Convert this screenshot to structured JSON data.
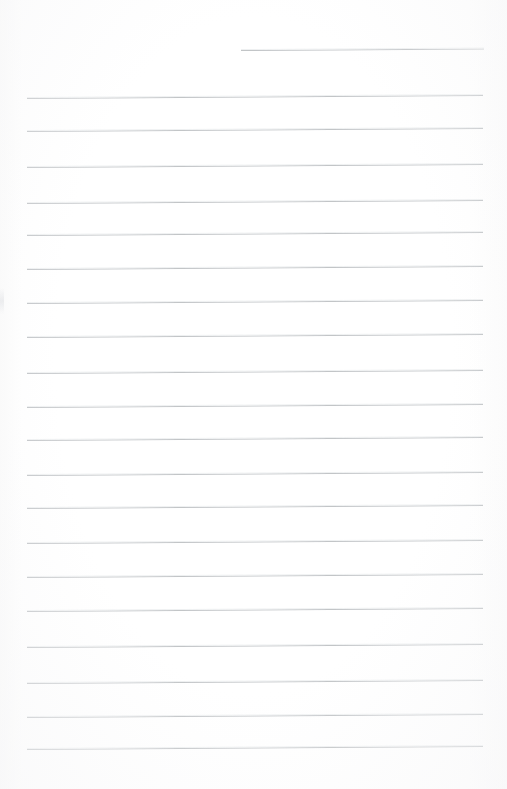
{
  "document": {
    "kind": "scanned-lined-paper",
    "title": "Blank lined notebook page",
    "page_width": 507,
    "page_height": 789,
    "background_color": "#ffffff",
    "rule_color": "#bfc2c5",
    "rule_thickness_px": 1,
    "rule_spacing_px": 34,
    "skew_degrees": -0.38,
    "text_content": "",
    "line_count": 21,
    "margin_left_px": 27,
    "margin_right_px": 483
  },
  "rules": [
    {
      "id": "rule-1",
      "y": 50,
      "x_start": 241,
      "x_end": 484,
      "variant": "short"
    },
    {
      "id": "rule-2",
      "y": 98,
      "x_start": 27,
      "x_end": 483,
      "variant": "full"
    },
    {
      "id": "rule-3",
      "y": 131,
      "x_start": 27,
      "x_end": 483,
      "variant": "full"
    },
    {
      "id": "rule-4",
      "y": 167,
      "x_start": 27,
      "x_end": 483,
      "variant": "full"
    },
    {
      "id": "rule-5",
      "y": 203,
      "x_start": 27,
      "x_end": 483,
      "variant": "full"
    },
    {
      "id": "rule-6",
      "y": 235,
      "x_start": 27,
      "x_end": 483,
      "variant": "full"
    },
    {
      "id": "rule-7",
      "y": 269,
      "x_start": 27,
      "x_end": 483,
      "variant": "full"
    },
    {
      "id": "rule-8",
      "y": 303,
      "x_start": 27,
      "x_end": 483,
      "variant": "full"
    },
    {
      "id": "rule-9",
      "y": 337,
      "x_start": 27,
      "x_end": 483,
      "variant": "full"
    },
    {
      "id": "rule-10",
      "y": 373,
      "x_start": 27,
      "x_end": 483,
      "variant": "full"
    },
    {
      "id": "rule-11",
      "y": 407,
      "x_start": 27,
      "x_end": 483,
      "variant": "full"
    },
    {
      "id": "rule-12",
      "y": 440,
      "x_start": 27,
      "x_end": 483,
      "variant": "full"
    },
    {
      "id": "rule-13",
      "y": 475,
      "x_start": 27,
      "x_end": 483,
      "variant": "full"
    },
    {
      "id": "rule-14",
      "y": 508,
      "x_start": 27,
      "x_end": 483,
      "variant": "full"
    },
    {
      "id": "rule-15",
      "y": 543,
      "x_start": 27,
      "x_end": 483,
      "variant": "full"
    },
    {
      "id": "rule-16",
      "y": 577,
      "x_start": 27,
      "x_end": 483,
      "variant": "full"
    },
    {
      "id": "rule-17",
      "y": 611,
      "x_start": 27,
      "x_end": 483,
      "variant": "full"
    },
    {
      "id": "rule-18",
      "y": 647,
      "x_start": 27,
      "x_end": 483,
      "variant": "full"
    },
    {
      "id": "rule-19",
      "y": 683,
      "x_start": 27,
      "x_end": 483,
      "variant": "full"
    },
    {
      "id": "rule-20",
      "y": 717,
      "x_start": 27,
      "x_end": 483,
      "variant": "full"
    },
    {
      "id": "rule-21",
      "y": 749,
      "x_start": 27,
      "x_end": 483,
      "variant": "full"
    }
  ]
}
